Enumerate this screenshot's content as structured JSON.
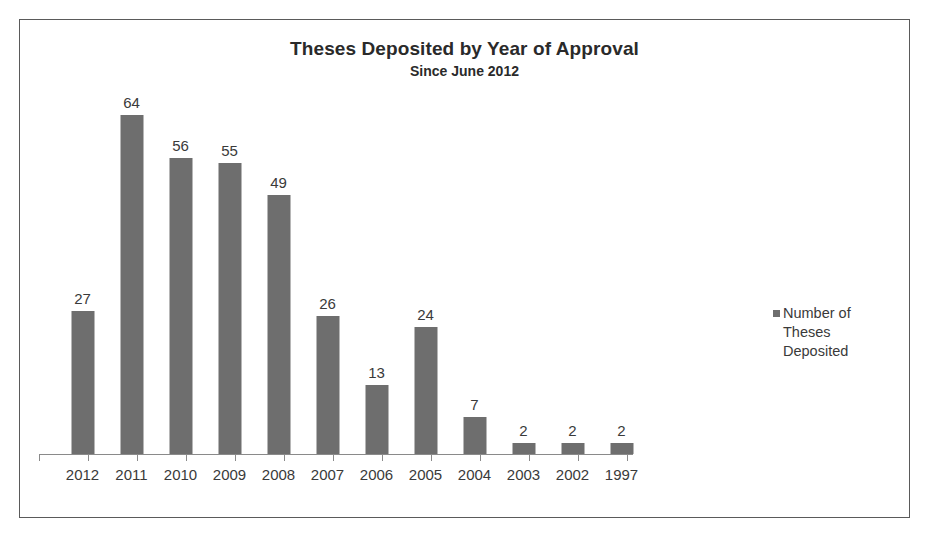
{
  "chart_data": {
    "type": "bar",
    "title": "Theses Deposited by Year of Approval",
    "subtitle": "Since June 2012",
    "xlabel": "",
    "ylabel": "",
    "grid": false,
    "legend_position": "right",
    "axis_visible": "x-only",
    "ylim": [
      0,
      68
    ],
    "categories": [
      "2012",
      "2011",
      "2010",
      "2009",
      "2008",
      "2007",
      "2006",
      "2005",
      "2004",
      "2003",
      "2002",
      "1997"
    ],
    "values": [
      27,
      64,
      56,
      55,
      49,
      26,
      13,
      24,
      7,
      2,
      2,
      2
    ],
    "data_labels": [
      "27",
      "64",
      "56",
      "55",
      "49",
      "26",
      "13",
      "24",
      "7",
      "2",
      "2",
      "2"
    ],
    "series": [
      {
        "name": "Number of Theses Deposited",
        "color": "#6e6e6e",
        "values": [
          27,
          64,
          56,
          55,
          49,
          26,
          13,
          24,
          7,
          2,
          2,
          2
        ]
      }
    ]
  },
  "legend": {
    "entries": [
      {
        "label": "Number of Theses Deposited",
        "color": "#6e6e6e",
        "swatch": "square-marker"
      }
    ]
  },
  "colors": {
    "bar": "#6e6e6e",
    "frame_border": "#5a5a5a",
    "axis_line": "#8a8a8a",
    "text": "#3a3a3a",
    "title_text": "#2a2a2a",
    "background": "#ffffff"
  }
}
